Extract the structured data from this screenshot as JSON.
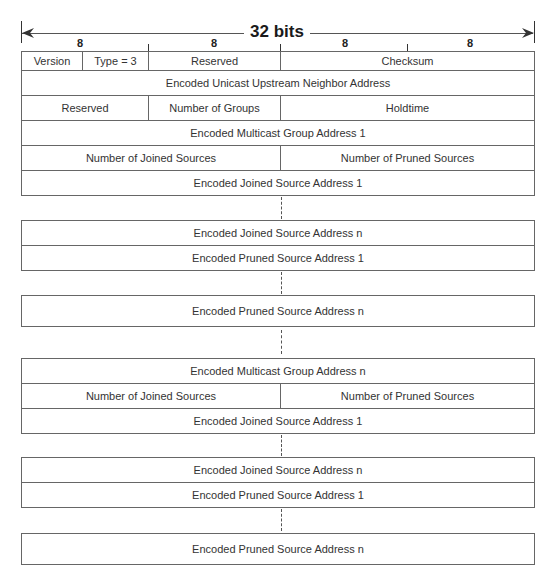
{
  "header": {
    "title": "32 bits",
    "column_widths": [
      "8",
      "8",
      "8",
      "8"
    ]
  },
  "group1": {
    "version": "Version",
    "type": "Type = 3",
    "reserved1": "Reserved",
    "checksum": "Checksum",
    "upstream_neighbor": "Encoded Unicast Upstream Neighbor Address",
    "reserved2": "Reserved",
    "num_groups": "Number of Groups",
    "holdtime": "Holdtime",
    "multicast_group": "Encoded Multicast Group Address 1",
    "num_joined": "Number of Joined Sources",
    "num_pruned": "Number of Pruned Sources",
    "joined_1": "Encoded Joined Source Address 1",
    "joined_n": "Encoded Joined Source Address n",
    "pruned_1": "Encoded Pruned Source Address 1",
    "pruned_n": "Encoded Pruned Source Address n"
  },
  "group_n": {
    "multicast_group": "Encoded Multicast Group Address n",
    "num_joined": "Number of Joined Sources",
    "num_pruned": "Number of Pruned Sources",
    "joined_1": "Encoded Joined Source Address 1",
    "joined_n": "Encoded Joined Source Address n",
    "pruned_1": "Encoded Pruned Source Address 1",
    "pruned_n": "Encoded Pruned Source Address n"
  }
}
